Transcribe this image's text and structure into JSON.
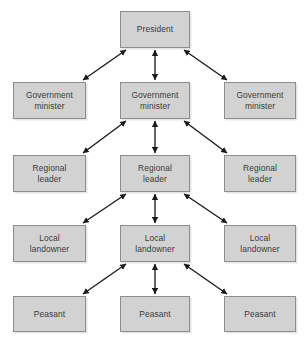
{
  "diagram": {
    "type": "hierarchy-pyramid",
    "background_color": "#ffffff",
    "box_fill_color": "#d2d2d2",
    "box_border_color": "#8d8d8d",
    "text_color": "#3b3b3b",
    "arrow_color": "#1a1a1a",
    "arrow_style": "double-headed",
    "levels": [
      {
        "index": 0,
        "name": "president-level",
        "nodes": [
          {
            "id": "president",
            "column": "center",
            "label": "President",
            "x": 120,
            "y": 11,
            "w": 70,
            "h": 37
          }
        ]
      },
      {
        "index": 1,
        "name": "government-minister-level",
        "nodes": [
          {
            "id": "gov-minister-left",
            "column": "left",
            "label": "Government\nminister",
            "x": 13,
            "y": 82,
            "w": 73,
            "h": 37
          },
          {
            "id": "gov-minister-center",
            "column": "center",
            "label": "Government\nminister",
            "x": 120,
            "y": 82,
            "w": 70,
            "h": 37
          },
          {
            "id": "gov-minister-right",
            "column": "right",
            "label": "Government\nminister",
            "x": 224,
            "y": 82,
            "w": 72,
            "h": 37
          }
        ]
      },
      {
        "index": 2,
        "name": "regional-leader-level",
        "nodes": [
          {
            "id": "regional-leader-left",
            "column": "left",
            "label": "Regional\nleader",
            "x": 13,
            "y": 155,
            "w": 73,
            "h": 37
          },
          {
            "id": "regional-leader-center",
            "column": "center",
            "label": "Regional\nleader",
            "x": 120,
            "y": 155,
            "w": 70,
            "h": 37
          },
          {
            "id": "regional-leader-right",
            "column": "right",
            "label": "Regional\nleader",
            "x": 224,
            "y": 155,
            "w": 72,
            "h": 37
          }
        ]
      },
      {
        "index": 3,
        "name": "local-landowner-level",
        "nodes": [
          {
            "id": "local-landowner-left",
            "column": "left",
            "label": "Local\nlandowner",
            "x": 13,
            "y": 225,
            "w": 73,
            "h": 37
          },
          {
            "id": "local-landowner-center",
            "column": "center",
            "label": "Local\nlandowner",
            "x": 120,
            "y": 225,
            "w": 70,
            "h": 37
          },
          {
            "id": "local-landowner-right",
            "column": "right",
            "label": "Local\nlandowner",
            "x": 224,
            "y": 225,
            "w": 72,
            "h": 37
          }
        ]
      },
      {
        "index": 4,
        "name": "peasant-level",
        "nodes": [
          {
            "id": "peasant-left",
            "column": "left",
            "label": "Peasant",
            "x": 13,
            "y": 296,
            "w": 73,
            "h": 36
          },
          {
            "id": "peasant-center",
            "column": "center",
            "label": "Peasant",
            "x": 120,
            "y": 296,
            "w": 70,
            "h": 36
          },
          {
            "id": "peasant-right",
            "column": "right",
            "label": "Peasant",
            "x": 224,
            "y": 296,
            "w": 72,
            "h": 36
          }
        ]
      }
    ],
    "connections": [
      {
        "id": "pres-to-gov-left",
        "from": "president",
        "to": "gov-minister-left",
        "kind": "diagonal-left",
        "arrowheads": "both"
      },
      {
        "id": "pres-to-gov-center",
        "from": "president",
        "to": "gov-minister-center",
        "kind": "vertical",
        "arrowheads": "both"
      },
      {
        "id": "pres-to-gov-right",
        "from": "president",
        "to": "gov-minister-right",
        "kind": "diagonal-right",
        "arrowheads": "both"
      },
      {
        "id": "gov-to-regional-left",
        "from": "gov-minister-center",
        "to": "regional-leader-left",
        "kind": "diagonal-left",
        "arrowheads": "both"
      },
      {
        "id": "gov-to-regional-center",
        "from": "gov-minister-center",
        "to": "regional-leader-center",
        "kind": "vertical",
        "arrowheads": "both"
      },
      {
        "id": "gov-to-regional-right",
        "from": "gov-minister-center",
        "to": "regional-leader-right",
        "kind": "diagonal-right",
        "arrowheads": "both"
      },
      {
        "id": "regional-to-local-left",
        "from": "regional-leader-center",
        "to": "local-landowner-left",
        "kind": "diagonal-left",
        "arrowheads": "both"
      },
      {
        "id": "regional-to-local-center",
        "from": "regional-leader-center",
        "to": "local-landowner-center",
        "kind": "vertical",
        "arrowheads": "both"
      },
      {
        "id": "regional-to-local-right",
        "from": "regional-leader-center",
        "to": "local-landowner-right",
        "kind": "diagonal-right",
        "arrowheads": "both"
      },
      {
        "id": "local-to-peasant-left",
        "from": "local-landowner-center",
        "to": "peasant-left",
        "kind": "diagonal-left",
        "arrowheads": "both"
      },
      {
        "id": "local-to-peasant-center",
        "from": "local-landowner-center",
        "to": "peasant-center",
        "kind": "vertical",
        "arrowheads": "both"
      },
      {
        "id": "local-to-peasant-right",
        "from": "local-landowner-center",
        "to": "peasant-right",
        "kind": "diagonal-right",
        "arrowheads": "both"
      }
    ]
  }
}
